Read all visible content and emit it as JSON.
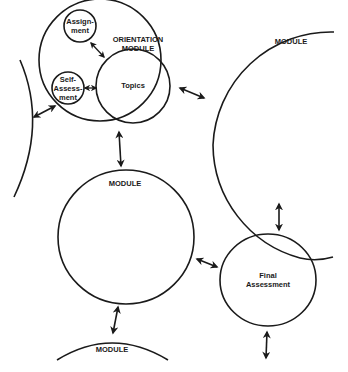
{
  "diagram": {
    "colors": {
      "stroke": "#1a1a1a",
      "background": "#ffffff"
    },
    "nodes": {
      "orientation_module": {
        "label_line1": "ORIENTATION",
        "label_line2": "MODULE"
      },
      "assignment": {
        "label_line1": "Assign-",
        "label_line2": "ment"
      },
      "self_assessment": {
        "label_line1": "Self-",
        "label_line2": "Assess-",
        "label_line3": "ment"
      },
      "topics": {
        "label": "Topics"
      },
      "module_right": {
        "label": "MODULE"
      },
      "module_middle": {
        "label": "MODULE"
      },
      "module_bottom": {
        "label": "MODULE"
      },
      "final_assessment": {
        "label_line1": "Final",
        "label_line2": "Assessment"
      }
    },
    "connectors": [
      {
        "from": "assignment",
        "to": "topics",
        "type": "bidirectional"
      },
      {
        "from": "self_assessment",
        "to": "topics",
        "type": "bidirectional"
      },
      {
        "from": "orientation_module",
        "to": "module_left_partial",
        "type": "bidirectional"
      },
      {
        "from": "orientation_module",
        "to": "module_right",
        "type": "bidirectional"
      },
      {
        "from": "orientation_module",
        "to": "module_middle",
        "type": "bidirectional"
      },
      {
        "from": "module_right",
        "to": "final_assessment",
        "type": "bidirectional"
      },
      {
        "from": "module_middle",
        "to": "final_assessment",
        "type": "bidirectional"
      },
      {
        "from": "module_middle",
        "to": "module_bottom",
        "type": "bidirectional"
      },
      {
        "from": "final_assessment",
        "to": "offscreen_below",
        "type": "bidirectional"
      }
    ]
  }
}
